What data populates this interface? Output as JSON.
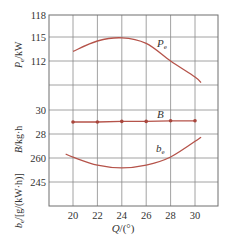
{
  "chart_data": {
    "type": "line",
    "title": "",
    "xlabel": "Q/(°)",
    "x_ticks": [
      20,
      22,
      24,
      26,
      28,
      30
    ],
    "xlim": [
      18,
      32
    ],
    "grid": true,
    "colors": {
      "curve": "#b5534a",
      "grid": "#8a8a8a",
      "marker": "#a8463c"
    },
    "panels": [
      {
        "name": "Pe",
        "ylabel": "Pe/kW",
        "y_ticks": [
          112,
          115,
          118
        ],
        "series": [
          {
            "name": "Pe",
            "x": [
              20,
              22,
              24,
              26,
              28,
              30,
              30.5
            ],
            "values": [
              113.2,
              114.5,
              114.9,
              114.2,
              112.0,
              110.0,
              109.3
            ]
          }
        ]
      },
      {
        "name": "B",
        "ylabel": "B/kg·h",
        "y_ticks": [
          28,
          30
        ],
        "series": [
          {
            "name": "B",
            "x": [
              20,
              22,
              24,
              26,
              28,
              30
            ],
            "values": [
              29.0,
              29.0,
              29.05,
              29.05,
              29.1,
              29.1
            ],
            "markers": true
          }
        ]
      },
      {
        "name": "be",
        "ylabel": "be/[g/(kW·h)]",
        "y_ticks": [
          245,
          260
        ],
        "series": [
          {
            "name": "be",
            "x": [
              19.4,
              20,
              22,
              24,
              26,
              28,
              30.5
            ],
            "values": [
              262.5,
              260.5,
              255.5,
              253.8,
              255.5,
              260.6,
              273.0
            ]
          }
        ]
      }
    ]
  },
  "labels": {
    "pe_axis": "P",
    "pe_axis_sub": "e",
    "pe_axis_unit": "/kW",
    "b_axis": "B/kg·h",
    "be_axis": "b",
    "be_axis_sub": "e",
    "be_axis_unit": "/[g/(kW·h)]",
    "x_axis": "Q/(°)",
    "curve_pe": "P",
    "curve_pe_sub": "e",
    "curve_b": "B",
    "curve_be": "b",
    "curve_be_sub": "e",
    "ticks_y": [
      "118",
      "115",
      "112",
      "30",
      "28",
      "260",
      "245"
    ],
    "ticks_x": [
      "20",
      "22",
      "24",
      "26",
      "28",
      "30"
    ]
  }
}
